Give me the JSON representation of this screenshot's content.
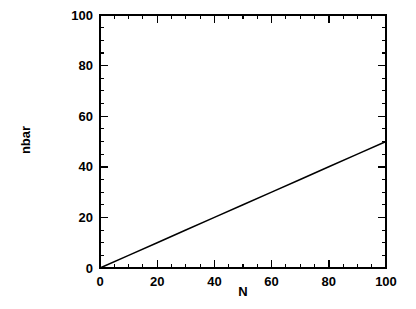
{
  "chart_data": {
    "type": "line",
    "title": "",
    "subtitle": "",
    "xlabel": "N",
    "ylabel": "nbar",
    "xlim": [
      0,
      100
    ],
    "ylim": [
      0,
      100
    ],
    "xticks": [
      0,
      20,
      40,
      60,
      80,
      100
    ],
    "yticks": [
      0,
      20,
      40,
      60,
      80,
      100
    ],
    "xtick_labels": [
      "0",
      "20",
      "40",
      "60",
      "80",
      "100"
    ],
    "ytick_labels": [
      "0",
      "20",
      "40",
      "60",
      "80",
      "100"
    ],
    "xminor_step": 5,
    "yminor_step": 5,
    "grid": false,
    "legend": null,
    "annotations": [],
    "series": [
      {
        "name": "nbar",
        "color": "#000000",
        "x": [
          0,
          10,
          20,
          30,
          40,
          50,
          60,
          70,
          80,
          90,
          100
        ],
        "values": [
          0,
          5,
          10,
          15,
          20,
          25,
          30,
          35,
          40,
          45,
          50
        ]
      }
    ]
  },
  "axis": {
    "x_title": "N",
    "y_title": "nbar",
    "x_labels": [
      "0",
      "20",
      "40",
      "60",
      "80",
      "100"
    ],
    "y_labels": [
      "0",
      "20",
      "40",
      "60",
      "80",
      "100"
    ]
  },
  "colors": {
    "background": "#ffffff",
    "foreground": "#000000",
    "series": "#000000"
  }
}
